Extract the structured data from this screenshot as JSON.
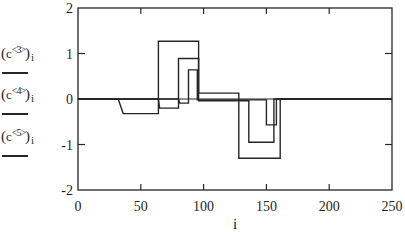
{
  "figure": {
    "background": "#ffffff",
    "line_color": "#262626",
    "text_color": "#1f1f1f"
  },
  "legend": {
    "items": [
      {
        "open": "(",
        "base": "c",
        "sup": "<3>",
        "close": ")",
        "sub": "i"
      },
      {
        "open": "(",
        "base": "c",
        "sup": "<4>",
        "close": ")",
        "sub": "i"
      },
      {
        "open": "(",
        "base": "c",
        "sup": "<5>",
        "close": ")",
        "sub": "i"
      }
    ]
  },
  "chart_data": {
    "type": "line",
    "title": "",
    "xlabel": "i",
    "ylabel": "(c<3>)i, (c<4>)i, (c<5>)i",
    "xlim": [
      0,
      250
    ],
    "ylim": [
      -2,
      2
    ],
    "grid": false,
    "legend_position": "left",
    "zero_axis_line": true,
    "x_ticks": [
      {
        "label": "0",
        "value": 0
      },
      {
        "label": "50",
        "value": 50
      },
      {
        "label": "100",
        "value": 100
      },
      {
        "label": "150",
        "value": 150
      },
      {
        "label": "200",
        "value": 200
      },
      {
        "label": "250",
        "value": 250
      }
    ],
    "y_ticks": [
      {
        "label": "2",
        "value": 2
      },
      {
        "label": "1",
        "value": 1
      },
      {
        "label": "0",
        "value": 0
      },
      {
        "label": "-1",
        "value": -1
      },
      {
        "label": "-2",
        "value": -2
      }
    ],
    "x_interior_ticks": [
      50,
      100,
      150,
      200
    ],
    "y_interior_ticks": [
      1,
      -1
    ],
    "series": [
      {
        "name": "c<3>",
        "points": [
          [
            0,
            0
          ],
          [
            32,
            0
          ],
          [
            36,
            -0.32
          ],
          [
            64,
            -0.32
          ],
          [
            64,
            1.27
          ],
          [
            96,
            1.27
          ],
          [
            96,
            0.13
          ],
          [
            128,
            0.13
          ],
          [
            128,
            -1.3
          ],
          [
            161,
            -1.3
          ],
          [
            161,
            0
          ],
          [
            250,
            0
          ]
        ]
      },
      {
        "name": "c<4>",
        "points": [
          [
            0,
            0
          ],
          [
            64,
            0
          ],
          [
            65,
            -0.2
          ],
          [
            80,
            -0.2
          ],
          [
            80,
            0.89
          ],
          [
            96,
            0.89
          ],
          [
            96,
            -0.04
          ],
          [
            136,
            -0.04
          ],
          [
            136,
            -0.95
          ],
          [
            156,
            -0.95
          ],
          [
            156,
            0
          ],
          [
            250,
            0
          ]
        ]
      },
      {
        "name": "c<5>",
        "points": [
          [
            0,
            0
          ],
          [
            80,
            0
          ],
          [
            81,
            -0.09
          ],
          [
            88,
            -0.09
          ],
          [
            88,
            0.64
          ],
          [
            95,
            0.64
          ],
          [
            95,
            -0.02
          ],
          [
            150,
            -0.02
          ],
          [
            150,
            -0.57
          ],
          [
            158,
            -0.57
          ],
          [
            158,
            0
          ],
          [
            250,
            0
          ]
        ]
      }
    ]
  }
}
